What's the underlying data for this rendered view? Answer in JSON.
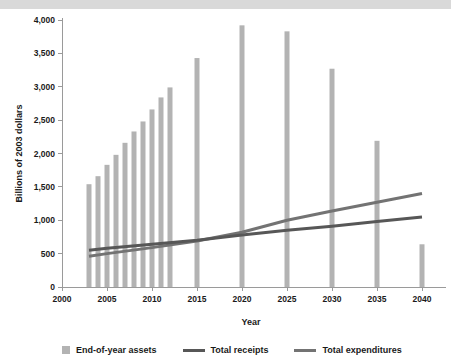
{
  "figure": {
    "banner_color": "#d9d9d9",
    "background": "#ffffff"
  },
  "legend": {
    "position": "bottom",
    "items": [
      {
        "label": "End-of-year assets",
        "marker": "square-swatch",
        "color": "#b3b3b3"
      },
      {
        "label": "Total receipts",
        "marker": "line-swatch",
        "color": "#575757"
      },
      {
        "label": "Total expenditures",
        "marker": "line-swatch",
        "color": "#737373"
      }
    ]
  },
  "chart_data": {
    "type": "bar",
    "title": "",
    "subtitle": "",
    "xlabel": "Year",
    "ylabel": "Billions of 2003 dollars",
    "xlim": [
      2000,
      2042
    ],
    "ylim": [
      0,
      4000
    ],
    "grid": false,
    "x_ticks": [
      2000,
      2005,
      2010,
      2015,
      2020,
      2025,
      2030,
      2035,
      2040
    ],
    "x_tick_labels": [
      "2000",
      "2005",
      "2010",
      "2015",
      "2020",
      "2025",
      "2030",
      "2035",
      "2040"
    ],
    "y_ticks": [
      0,
      500,
      1000,
      1500,
      2000,
      2500,
      3000,
      3500,
      4000
    ],
    "y_tick_labels": [
      "0",
      "500",
      "1,000",
      "1,500",
      "2,000",
      "2,500",
      "3,000",
      "3,500",
      "4,000"
    ],
    "bars": {
      "name": "End-of-year assets",
      "color": "#b3b3b3",
      "x": [
        2003,
        2004,
        2005,
        2006,
        2007,
        2008,
        2009,
        2010,
        2011,
        2012,
        2015,
        2020,
        2025,
        2030,
        2035,
        2040
      ],
      "values": [
        1540,
        1660,
        1830,
        1980,
        2160,
        2330,
        2480,
        2660,
        2840,
        2990,
        3430,
        3920,
        3830,
        3270,
        2190,
        640
      ]
    },
    "series": [
      {
        "name": "Total receipts",
        "type": "line",
        "color": "#575757",
        "x": [
          2003,
          2005,
          2010,
          2015,
          2020,
          2025,
          2030,
          2035,
          2040
        ],
        "values": [
          550,
          580,
          640,
          700,
          780,
          850,
          910,
          980,
          1050
        ]
      },
      {
        "name": "Total expenditures",
        "type": "line",
        "color": "#737373",
        "x": [
          2003,
          2005,
          2010,
          2015,
          2020,
          2025,
          2030,
          2035,
          2040
        ],
        "values": [
          460,
          500,
          590,
          690,
          820,
          1000,
          1140,
          1270,
          1400
        ]
      }
    ],
    "annotations": [
      {
        "text": "Lines cross near 2018",
        "x": 2018,
        "y": 760
      }
    ]
  }
}
